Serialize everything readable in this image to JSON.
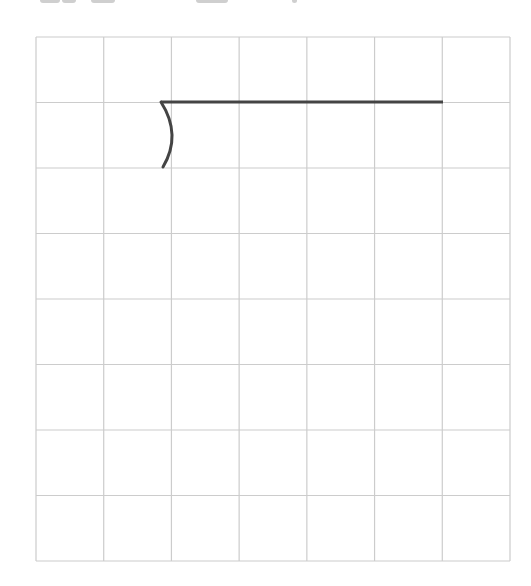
{
  "heading": {
    "note": "clipped text fragments at top edge; not legible",
    "fragments": [
      {
        "x": 40,
        "w": 20
      },
      {
        "x": 62,
        "w": 14
      },
      {
        "x": 91,
        "w": 24
      },
      {
        "x": 196,
        "w": 32
      },
      {
        "x": 292,
        "w": 5
      }
    ]
  },
  "grid": {
    "left": 36,
    "top": 37,
    "right": 510,
    "bottom": 561,
    "columns": 7,
    "rows": 8,
    "line_color": "#cccccc"
  },
  "division_bracket": {
    "stroke_color": "#444444",
    "stroke_width": 3,
    "bar": {
      "x1": 161,
      "y": 102,
      "x2": 443
    },
    "curve": {
      "start": [
        161,
        102
      ],
      "control": [
        182,
        135
      ],
      "end": [
        163,
        167
      ]
    }
  }
}
